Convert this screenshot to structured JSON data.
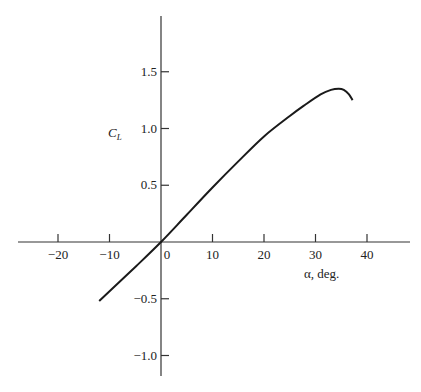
{
  "chart_data": {
    "type": "line",
    "title": "",
    "xlabel": "α, deg.",
    "ylabel": "C_L",
    "ylabel_main": "C",
    "ylabel_sub": "L",
    "xlim": [
      -27,
      48
    ],
    "ylim": [
      -1.2,
      1.95
    ],
    "grid": false,
    "xticks": [
      -20,
      -10,
      0,
      10,
      20,
      30,
      40
    ],
    "xtick_labels": [
      "−20",
      "−10",
      "0",
      "10",
      "20",
      "30",
      "40"
    ],
    "yticks": [
      1.5,
      1.0,
      0.5,
      -0.5,
      -1.0
    ],
    "ytick_labels": [
      "1.5",
      "1.0",
      "0.5",
      "−0.5",
      "−1.0"
    ],
    "series": [
      {
        "name": "Lift coefficient",
        "x": [
          -12,
          -5,
          0,
          5,
          10,
          15,
          20,
          25,
          28,
          31,
          33,
          34.5,
          35.5,
          36.5,
          37.2
        ],
        "y": [
          -0.52,
          -0.22,
          0.0,
          0.24,
          0.48,
          0.71,
          0.93,
          1.11,
          1.21,
          1.3,
          1.34,
          1.35,
          1.34,
          1.3,
          1.25
        ]
      }
    ]
  }
}
